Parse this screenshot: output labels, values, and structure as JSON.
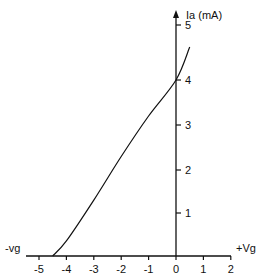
{
  "chart_data": {
    "type": "line",
    "title": "",
    "xlabel_neg": "-vg",
    "xlabel_pos": "+Vg",
    "ylabel": "Ia (mA)",
    "xlim": [
      -5.5,
      2
    ],
    "ylim": [
      0,
      5
    ],
    "x_ticks": [
      -5,
      -4,
      -3,
      -2,
      -1,
      0,
      1,
      2
    ],
    "y_ticks": [
      1,
      2,
      3,
      4,
      5
    ],
    "grid": false,
    "series": [
      {
        "name": "Ia vs Vg",
        "x": [
          -4.5,
          -4,
          -3,
          -2,
          -1,
          0,
          0.5
        ],
        "y": [
          0,
          0.35,
          1.3,
          2.3,
          3.2,
          4.0,
          4.6
        ]
      }
    ]
  },
  "axes": {
    "x_label_left": "-vg",
    "x_label_right": "+Vg",
    "y_label": "Ia (mA)",
    "x_tick_labels": [
      "-5",
      "-4",
      "-3",
      "-2",
      "-1",
      "0",
      "1",
      "2"
    ],
    "y_tick_labels": [
      "1",
      "2",
      "3",
      "4",
      "5"
    ]
  }
}
